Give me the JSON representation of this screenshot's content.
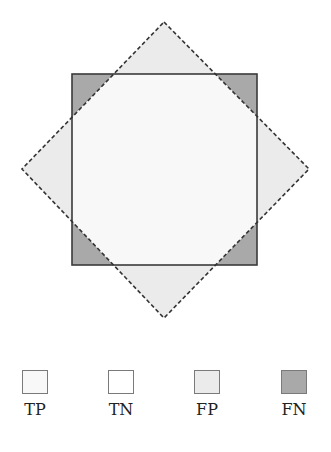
{
  "diagram": {
    "square": {
      "x": 72,
      "y": 74,
      "width": 185,
      "height": 191,
      "fill": "#a9a9a9",
      "stroke": "#3a3a3a",
      "label": "Actual region"
    },
    "diamond": {
      "points": [
        [
          164,
          22
        ],
        [
          309,
          169
        ],
        [
          164,
          318
        ],
        [
          22,
          169
        ]
      ],
      "fill": "#ebebeb",
      "stroke": "#333333",
      "dashed": true,
      "label": "Predicted region"
    },
    "overlap_fill": "#f8f8f8"
  },
  "legend": {
    "items": [
      {
        "label": "TP",
        "fill": "#f8f8f8",
        "cx": 35
      },
      {
        "label": "TN",
        "fill": "#ffffff",
        "cx": 121
      },
      {
        "label": "FP",
        "fill": "#ebebeb",
        "cx": 207
      },
      {
        "label": "FN",
        "fill": "#a9a9a9",
        "cx": 294
      }
    ]
  }
}
